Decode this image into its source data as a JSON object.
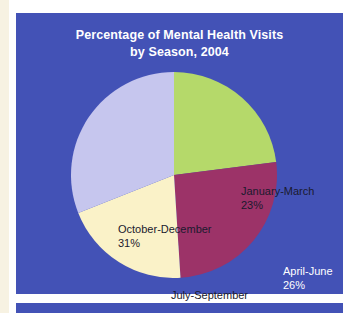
{
  "page": {
    "background_color": "#ffffff",
    "margin_color": "#f7f2e2",
    "panel_color": "#4352b6"
  },
  "chart_panel": {
    "title_line1": "Percentage of Mental Health Visits",
    "title_line2": "by Season, 2004",
    "title_color": "#ffffff"
  },
  "chart_data": {
    "type": "pie",
    "title": "Percentage of Mental Health Visits by Season, 2004",
    "xlabel": "",
    "ylabel": "",
    "legend_position": "none",
    "grid": false,
    "unit": "%",
    "start_angle_deg": 0,
    "direction": "clockwise",
    "categories": [
      "January-March",
      "April-June",
      "July-September",
      "October-December"
    ],
    "values": [
      23,
      26,
      20,
      31
    ],
    "colors": [
      "#b5d96a",
      "#9c3368",
      "#faf2c8",
      "#c6c6ee"
    ],
    "label_colors": [
      "#1a1a2e",
      "#ffffff",
      "#1a1a2e",
      "#1a1a2e"
    ],
    "slices": [
      {
        "name": "January-March",
        "value": 23,
        "value_label": "23%",
        "color": "#b5d96a",
        "label_color": "#1a1a2e",
        "start_angle_deg": 0,
        "end_angle_deg": 82.8
      },
      {
        "name": "April-June",
        "value": 26,
        "value_label": "26%",
        "color": "#9c3368",
        "label_color": "#ffffff",
        "start_angle_deg": 82.8,
        "end_angle_deg": 176.4
      },
      {
        "name": "July-September",
        "value": 20,
        "value_label": "20%",
        "color": "#faf2c8",
        "label_color": "#1a1a2e",
        "start_angle_deg": 176.4,
        "end_angle_deg": 248.4
      },
      {
        "name": "October-December",
        "value": 31,
        "value_label": "31%",
        "color": "#c6c6ee",
        "label_color": "#1a1a2e",
        "start_angle_deg": 248.4,
        "end_angle_deg": 360
      }
    ]
  }
}
